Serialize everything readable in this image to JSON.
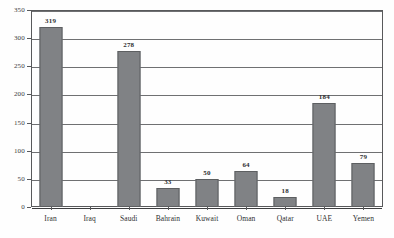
{
  "chart_data": {
    "type": "bar",
    "title": "",
    "subtitle": "",
    "xlabel": "",
    "ylabel": "",
    "categories": [
      "Iran",
      "Iraq",
      "Saudi",
      "Bahrain",
      "Kuwait",
      "Oman",
      "Qatar",
      "UAE",
      "Yemen"
    ],
    "values": [
      319,
      0,
      278,
      33,
      50,
      64,
      18,
      184,
      79
    ],
    "value_labels": [
      "319",
      "",
      "278",
      "33",
      "50",
      "64",
      "18",
      "184",
      "79"
    ],
    "ylim": [
      0,
      350
    ],
    "ytick_labels": [
      "0",
      "50",
      "100",
      "150",
      "200",
      "250",
      "300",
      "350"
    ],
    "ytick_values": [
      0,
      50,
      100,
      150,
      200,
      250,
      300,
      350
    ],
    "grid": true,
    "grid_axis": "y",
    "legend": false,
    "legend_position": "none",
    "series": [
      {
        "name": "",
        "values": [
          319,
          0,
          278,
          33,
          50,
          64,
          18,
          184,
          79
        ],
        "color": "#808285"
      }
    ],
    "colors": {
      "bar_fill": "#808285",
      "bar_border": "#5d5f61",
      "gridline": "#6f7072",
      "axis": "#58595b",
      "text": "#2e2f31",
      "background": "#ffffff"
    }
  }
}
